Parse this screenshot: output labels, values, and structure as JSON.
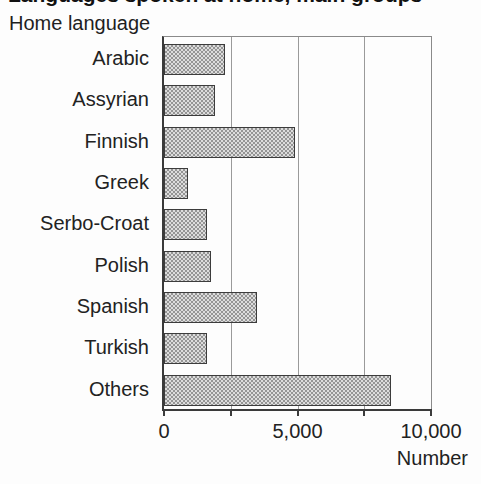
{
  "page": {
    "cropped_top_title": "Languages spoken at home, main groups",
    "subtitle": "Home language"
  },
  "chart_data": {
    "type": "bar",
    "orientation": "horizontal",
    "title": "Home language",
    "categories": [
      "Arabic",
      "Assyrian",
      "Finnish",
      "Greek",
      "Serbo-Croat",
      "Polish",
      "Spanish",
      "Turkish",
      "Others"
    ],
    "values": [
      2300,
      1900,
      4900,
      900,
      1600,
      1750,
      3500,
      1600,
      8500
    ],
    "xlabel": "Number",
    "xlim": [
      0,
      10000
    ],
    "xticks": [
      0,
      2500,
      5000,
      7500,
      10000
    ],
    "xtick_labels": [
      {
        "value": 0,
        "label": "0"
      },
      {
        "value": 5000,
        "label": "5,000"
      },
      {
        "value": 10000,
        "label": "10,000"
      }
    ],
    "gridlines": [
      2500,
      5000,
      7500
    ],
    "legend": "none"
  },
  "colors": {
    "background": "#fdfdfd",
    "bar_fill_light": "#dcdcdc",
    "bar_fill_dot": "#949494",
    "bar_border": "#3c3c3c",
    "axis": "#3a3a3a",
    "gridline": "#9a9a9a",
    "text": "#222222"
  }
}
